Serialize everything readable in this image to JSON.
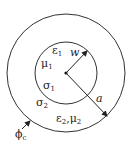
{
  "diagram": {
    "type": "concentric-circles",
    "center": {
      "x": 66,
      "y": 73
    },
    "inner_circle": {
      "radius": 31,
      "label_radius": "w"
    },
    "outer_circle": {
      "radius": 59,
      "label_radius": "a"
    },
    "stroke_color": "#333333"
  },
  "labels": {
    "eps1": {
      "base": "ε",
      "sub": "1"
    },
    "mu1": {
      "base": "μ",
      "sub": "1"
    },
    "sigma1": {
      "base": "σ",
      "sub": "1"
    },
    "sigma2": {
      "base": "σ",
      "sub": "2"
    },
    "w": "w",
    "a": "a",
    "eps2_mu2": {
      "base1": "ε",
      "sub1": "2",
      "sep": ",",
      "base2": "μ",
      "sub2": "2"
    },
    "phic": {
      "base": "ϕ",
      "sub": "c"
    }
  }
}
